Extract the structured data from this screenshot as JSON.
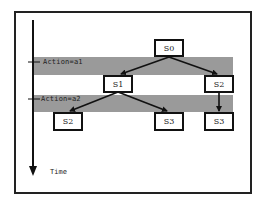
{
  "diagram": {
    "time_axis": {
      "label": "Time"
    },
    "action_bands": [
      {
        "label": "Action=a1"
      },
      {
        "label": "Action=a2"
      }
    ],
    "nodes": [
      {
        "id": "s0",
        "label": "S0"
      },
      {
        "id": "s1",
        "label": "S1"
      },
      {
        "id": "s2_top",
        "label": "S2"
      },
      {
        "id": "s2_bottom",
        "label": "S2"
      },
      {
        "id": "s3_mid",
        "label": "S3"
      },
      {
        "id": "s3_right",
        "label": "S3"
      }
    ],
    "edges": [
      {
        "from": "S0",
        "to": "S1"
      },
      {
        "from": "S0",
        "to": "S2"
      },
      {
        "from": "S1",
        "to": "S2"
      },
      {
        "from": "S1",
        "to": "S3"
      },
      {
        "from": "S2",
        "to": "S3"
      }
    ],
    "colors": {
      "band": "#9a9a9a",
      "stroke": "#111111",
      "background": "#ffffff"
    }
  }
}
